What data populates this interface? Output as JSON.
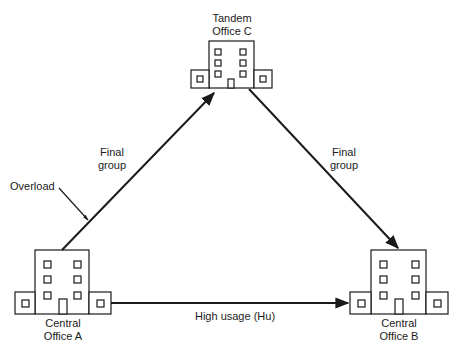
{
  "nodes": {
    "tandem": {
      "line1": "Tandem",
      "line2": "Office C"
    },
    "office_a": {
      "line1": "Central",
      "line2": "Office A"
    },
    "office_b": {
      "line1": "Central",
      "line2": "Office B"
    }
  },
  "edges": {
    "a_to_c": {
      "line1": "Final",
      "line2": "group"
    },
    "c_to_b": {
      "line1": "Final",
      "line2": "group"
    },
    "a_to_b": {
      "label": "High usage (Hu)"
    }
  },
  "annotations": {
    "overload": {
      "label": "Overload"
    }
  },
  "colors": {
    "stroke": "#1a1a1a",
    "background": "#ffffff"
  }
}
